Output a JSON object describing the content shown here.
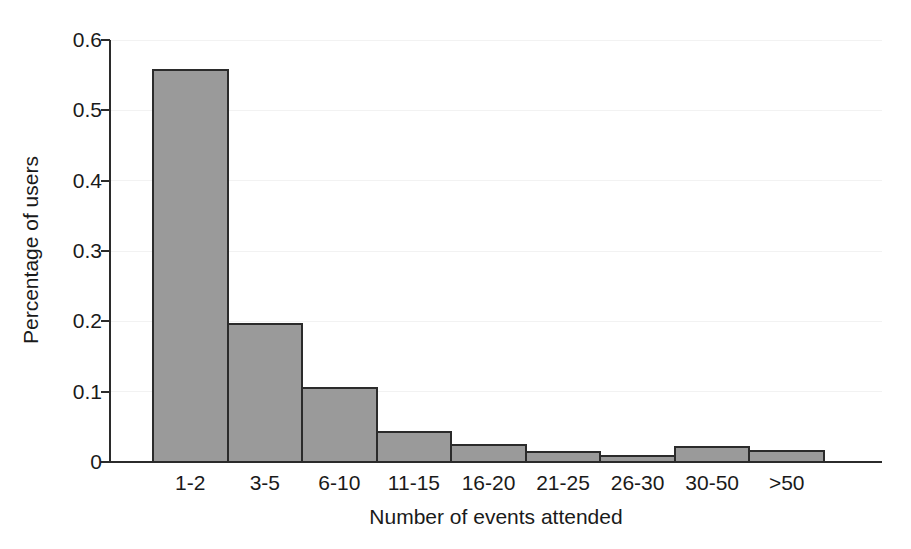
{
  "chart_data": {
    "type": "bar",
    "title": "",
    "subtitle": "",
    "xlabel": "Number of events attended",
    "ylabel": "Percentage of users",
    "categories": [
      "1-2",
      "3-5",
      "6-10",
      "11-15",
      "16-20",
      "21-25",
      "26-30",
      "30-50",
      ">50"
    ],
    "values": [
      0.557,
      0.196,
      0.105,
      0.042,
      0.024,
      0.014,
      0.009,
      0.021,
      0.016
    ],
    "ylim": [
      0,
      0.6
    ],
    "yticks": [
      0,
      0.1,
      0.2,
      0.3,
      0.4,
      0.5,
      0.6
    ],
    "ytick_labels": [
      "0",
      "0.1",
      "0.2",
      "0.3",
      "0.4",
      "0.5",
      "0.6"
    ],
    "grid": "faint-horizontal",
    "legend": null,
    "legend_position": "none",
    "bar_fill_color": "#9a9a9a",
    "bar_edge_color": "#2b2b2b",
    "axis_color": "#2b2b2b",
    "background_color": "#ffffff"
  },
  "figure": {
    "width": 911,
    "height": 549
  }
}
